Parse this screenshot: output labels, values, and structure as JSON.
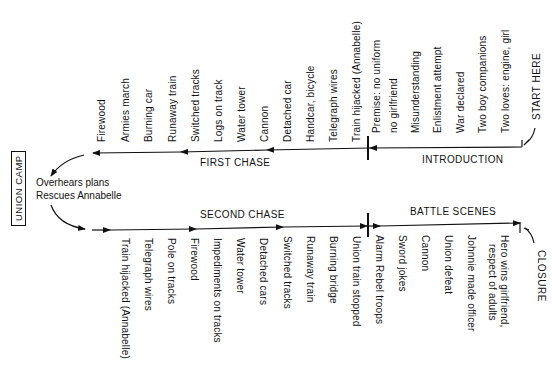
{
  "diagram": {
    "start_label": "START HERE",
    "closure_label": "CLOSURE",
    "union_camp_label": "UNION CAMP",
    "union_camp_notes": [
      "Overhears plans",
      "Rescues Annabelle"
    ],
    "sections": {
      "introduction": "INTRODUCTION",
      "first_chase": "FIRST CHASE",
      "second_chase": "SECOND CHASE",
      "battle_scenes": "BATTLE SCENES"
    },
    "introduction_items": [
      "Premise: no uniform",
      "no girlfriend",
      "Misunderstanding",
      "Enlistment attempt",
      "War declared",
      "Two boy companions",
      "Two loves: engine, girl"
    ],
    "first_chase_items": [
      "Firewood",
      "Armies march",
      "Burning car",
      "Runaway train",
      "Switched tracks",
      "Logs on track",
      "Water tower",
      "Cannon",
      "Detached car",
      "Handcar, bicycle",
      "Telegraph wires",
      "Train hijacked (Annabelle)"
    ],
    "second_chase_items": [
      "Train hijacked (Annabelle)",
      "Telegraph wires",
      "Pole on tracks",
      "Firewood",
      "Impediments on tracks",
      "Water tower",
      "Detached cars",
      "Switched tracks",
      "Runaway train",
      "Burning bridge",
      "Union train stopped"
    ],
    "battle_items": [
      "Alarm Rebel troops",
      "Sword jokes",
      "Cannon",
      "Union defeat",
      "Johnnie made officer",
      "Hero wins girlfriend,",
      "respect of adults"
    ],
    "colors": {
      "ink": "#111111",
      "paper": "#ffffff"
    }
  }
}
